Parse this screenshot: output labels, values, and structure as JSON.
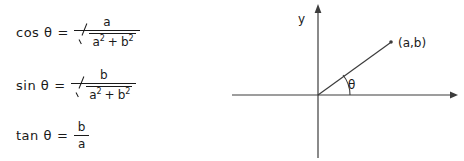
{
  "figure": {
    "formulas": [
      {
        "name": "cosine-identity",
        "function": "cos",
        "angle": "θ",
        "equals": "=",
        "numerator": "a",
        "denominator": {
          "radical": true,
          "term1": "a",
          "exp1": "2",
          "operator": "+",
          "term2": "b",
          "exp2": "2"
        }
      },
      {
        "name": "sine-identity",
        "function": "sin",
        "angle": "θ",
        "equals": "=",
        "numerator": "b",
        "denominator": {
          "radical": true,
          "term1": "a",
          "exp1": "2",
          "operator": "+",
          "term2": "b",
          "exp2": "2"
        }
      },
      {
        "name": "tangent-identity",
        "function": "tan",
        "angle": "θ",
        "equals": "=",
        "numerator": "b",
        "denominator": {
          "radical": false,
          "term1": "a"
        }
      }
    ],
    "diagram": {
      "y_axis_label": "y",
      "point_label": "(a,b)",
      "angle_label": "θ",
      "line_color": "#3c3c3c",
      "text_color": "#1a1a1a"
    }
  }
}
